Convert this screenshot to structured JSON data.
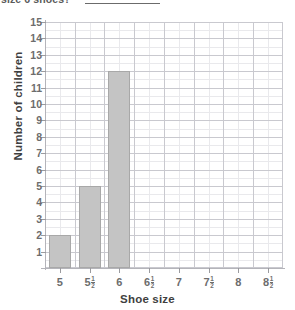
{
  "question": {
    "text": "size 6 shoes?",
    "answer_blank": ""
  },
  "chart_data": {
    "type": "bar",
    "title": "",
    "xlabel": "Shoe size",
    "ylabel": "Number of children",
    "categories": [
      "5",
      "5½",
      "6",
      "6½",
      "7",
      "7½",
      "8",
      "8½"
    ],
    "category_parts": [
      {
        "whole": "5",
        "num": "",
        "den": ""
      },
      {
        "whole": "5",
        "num": "1",
        "den": "2"
      },
      {
        "whole": "6",
        "num": "",
        "den": ""
      },
      {
        "whole": "6",
        "num": "1",
        "den": "2"
      },
      {
        "whole": "7",
        "num": "",
        "den": ""
      },
      {
        "whole": "7",
        "num": "1",
        "den": "2"
      },
      {
        "whole": "8",
        "num": "",
        "den": ""
      },
      {
        "whole": "8",
        "num": "1",
        "den": "2"
      }
    ],
    "values": [
      2,
      5,
      12,
      0,
      0,
      0,
      0,
      0
    ],
    "ylim": [
      0,
      15
    ],
    "ytick_labels": [
      "1",
      "2",
      "3",
      "4",
      "5",
      "6",
      "7",
      "8",
      "9",
      "10",
      "11",
      "12",
      "13",
      "14",
      "15"
    ],
    "grid": true,
    "legend": "none",
    "bar_color": "#c4c4c4",
    "bar_border_color": "#a8a8a8",
    "grid_color_major": "#c9c9cf",
    "grid_color_minor": "#e9e9ec",
    "axis_color": "#b4b4ba"
  }
}
